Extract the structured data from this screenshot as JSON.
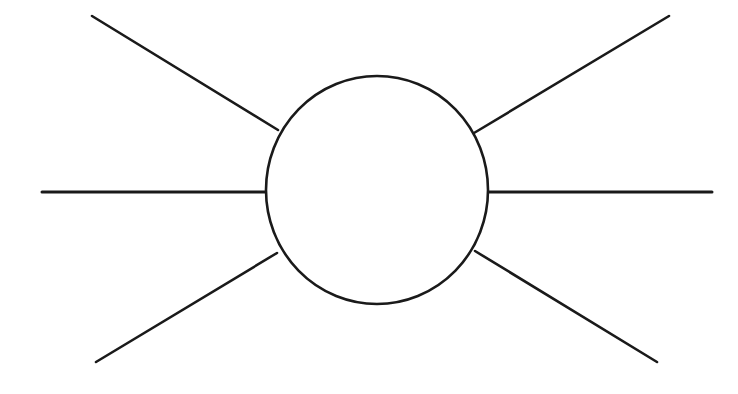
{
  "figure": {
    "type": "line-diagram",
    "canvas": {
      "width": 738,
      "height": 394,
      "background": "#ffffff"
    },
    "stroke_color": "#1a1a1a",
    "fill_color": "#ffffff",
    "blob": {
      "label": "central-blob",
      "shape": "ellipse",
      "cx": 377,
      "cy": 190,
      "rx": 111,
      "ry": 114,
      "stroke_width": 2.6
    },
    "legs": [
      {
        "label": "upper-left-leg",
        "x1": 92,
        "y1": 16,
        "x2": 278,
        "y2": 130,
        "stroke_width": 2.6
      },
      {
        "label": "middle-left-leg",
        "x1": 42,
        "y1": 192,
        "x2": 267,
        "y2": 192,
        "stroke_width": 3.0
      },
      {
        "label": "lower-left-leg",
        "x1": 96,
        "y1": 362,
        "x2": 277,
        "y2": 253,
        "stroke_width": 2.6
      },
      {
        "label": "upper-right-leg",
        "x1": 474,
        "y1": 133,
        "x2": 669,
        "y2": 16,
        "stroke_width": 2.6
      },
      {
        "label": "middle-right-leg",
        "x1": 487,
        "y1": 192,
        "x2": 712,
        "y2": 192,
        "stroke_width": 3.0
      },
      {
        "label": "lower-right-leg",
        "x1": 475,
        "y1": 251,
        "x2": 657,
        "y2": 362,
        "stroke_width": 2.6
      }
    ]
  }
}
